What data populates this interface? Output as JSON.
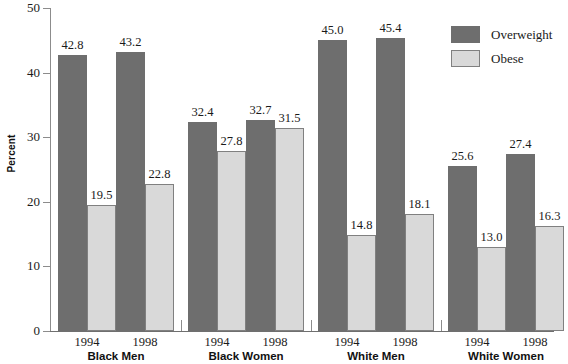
{
  "chart_data": {
    "type": "bar",
    "title": "",
    "subtitle": "",
    "xlabel": "",
    "ylabel": "Percent",
    "ylim": [
      0,
      50
    ],
    "yticks": [
      0,
      10,
      20,
      30,
      40,
      50
    ],
    "ytick_labels": [
      "0",
      "10",
      "20",
      "30",
      "40",
      "50"
    ],
    "grid": false,
    "legend_position": "top-right",
    "groups": [
      "Black Men",
      "Black Women",
      "White Men",
      "White Women"
    ],
    "subcategories": [
      "1994",
      "1998"
    ],
    "categories": [
      "Black Men 1994",
      "Black Men 1998",
      "Black Women 1994",
      "Black Women 1998",
      "White Men 1994",
      "White Men 1998",
      "White Women 1994",
      "White Women 1998"
    ],
    "series": [
      {
        "name": "Overweight",
        "color": "#6e6e6e",
        "values": [
          42.8,
          43.2,
          32.4,
          32.7,
          45.0,
          45.4,
          25.6,
          27.4
        ]
      },
      {
        "name": "Obese",
        "color": "#d9d9d9",
        "values": [
          19.5,
          22.8,
          27.8,
          31.5,
          14.8,
          18.1,
          13.0,
          16.3
        ]
      }
    ],
    "bar_groups": [
      {
        "group": "Black Men",
        "bars": [
          {
            "year": "1994",
            "series": "Overweight",
            "value": 42.8,
            "label": "42.8"
          },
          {
            "year": "1994",
            "series": "Obese",
            "value": 19.5,
            "label": "19.5"
          },
          {
            "year": "1998",
            "series": "Overweight",
            "value": 43.2,
            "label": "43.2"
          },
          {
            "year": "1998",
            "series": "Obese",
            "value": 22.8,
            "label": "22.8"
          }
        ]
      },
      {
        "group": "Black Women",
        "bars": [
          {
            "year": "1994",
            "series": "Overweight",
            "value": 32.4,
            "label": "32.4"
          },
          {
            "year": "1994",
            "series": "Obese",
            "value": 27.8,
            "label": "27.8"
          },
          {
            "year": "1998",
            "series": "Overweight",
            "value": 32.7,
            "label": "32.7"
          },
          {
            "year": "1998",
            "series": "Obese",
            "value": 31.5,
            "label": "31.5"
          }
        ]
      },
      {
        "group": "White Men",
        "bars": [
          {
            "year": "1994",
            "series": "Overweight",
            "value": 45.0,
            "label": "45.0"
          },
          {
            "year": "1994",
            "series": "Obese",
            "value": 14.8,
            "label": "14.8"
          },
          {
            "year": "1998",
            "series": "Overweight",
            "value": 45.4,
            "label": "45.4"
          },
          {
            "year": "1998",
            "series": "Obese",
            "value": 18.1,
            "label": "18.1"
          }
        ]
      },
      {
        "group": "White Women",
        "bars": [
          {
            "year": "1994",
            "series": "Overweight",
            "value": 25.6,
            "label": "25.6"
          },
          {
            "year": "1994",
            "series": "Obese",
            "value": 13.0,
            "label": "13.0"
          },
          {
            "year": "1998",
            "series": "Overweight",
            "value": 27.4,
            "label": "27.4"
          },
          {
            "year": "1998",
            "series": "Obese",
            "value": 16.3,
            "label": "16.3"
          }
        ]
      }
    ],
    "legend": [
      {
        "label": "Overweight",
        "color": "#6e6e6e"
      },
      {
        "label": "Obese",
        "color": "#d9d9d9"
      }
    ]
  },
  "layout": {
    "plot_left": 50,
    "plot_bottom_y": 331,
    "plot_top_y": 8,
    "bar_width": 29,
    "group_width": 116,
    "group_starts": [
      8,
      138,
      268,
      398
    ]
  }
}
